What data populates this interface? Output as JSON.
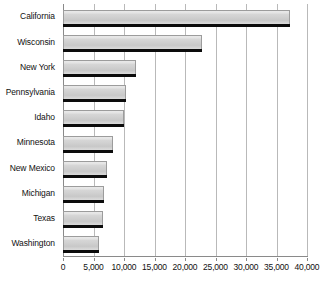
{
  "chart_data": {
    "type": "bar",
    "orientation": "horizontal",
    "title": "",
    "subtitle": "",
    "xlabel": "",
    "ylabel": "",
    "categories": [
      "California",
      "Wisconsin",
      "New York",
      "Pennsylvania",
      "Idaho",
      "Minnesota",
      "New Mexico",
      "Michigan",
      "Texas",
      "Washington"
    ],
    "values": [
      37200,
      22800,
      12000,
      10400,
      10000,
      8200,
      7200,
      6800,
      6600,
      5900
    ],
    "series": [
      {
        "name": "",
        "values": [
          37200,
          22800,
          12000,
          10400,
          10000,
          8200,
          7200,
          6800,
          6600,
          5900
        ]
      }
    ],
    "xlim": [
      0,
      40000
    ],
    "xticks": [
      0,
      5000,
      10000,
      15000,
      20000,
      25000,
      30000,
      35000,
      40000
    ],
    "xtick_labels": [
      "0",
      "5,000",
      "10,000",
      "15,000",
      "20,000",
      "25,000",
      "30,000",
      "35,000",
      "40,000"
    ],
    "grid": true,
    "grid_axis": "x",
    "legend": false,
    "legend_position": "none",
    "annotations": [],
    "colors": {
      "bar_fill": "#cfcfcf",
      "bar_highlight": "#e9e9e9",
      "bar_shadow": "#0c0c0c",
      "bar_border": "#9c9c9c",
      "gridline": "#b9b9b9",
      "axis_line": "#8a8a8a",
      "text": "#111111",
      "background": "#ffffff"
    }
  }
}
